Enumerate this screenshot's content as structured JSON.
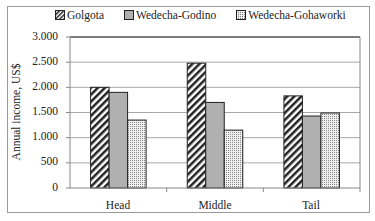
{
  "chart_data": {
    "type": "bar",
    "title": "",
    "xlabel": "",
    "ylabel": "Annual income, US$",
    "ylim": [
      0,
      3000
    ],
    "yticks": [
      0,
      500,
      1000,
      1500,
      2000,
      2500,
      3000
    ],
    "ytick_labels": [
      "0",
      "500",
      "1.000",
      "1.500",
      "2.000",
      "2.500",
      "3.000"
    ],
    "grid": true,
    "legend_position": "top",
    "categories": [
      "Head",
      "Middle",
      "Tail"
    ],
    "series": [
      {
        "name": "Golgota",
        "pattern": "diagonal-stripes",
        "values": [
          2000,
          2480,
          1830
        ]
      },
      {
        "name": "Wedecha-Godino",
        "pattern": "solid-gray",
        "values": [
          1900,
          1700,
          1430
        ]
      },
      {
        "name": "Wedecha-Gohaworki",
        "pattern": "dotted",
        "values": [
          1350,
          1150,
          1490
        ]
      }
    ]
  },
  "legend": {
    "items": [
      "Golgota",
      "Wedecha-Godino",
      "Wedecha-Gohaworki"
    ]
  },
  "axis": {
    "ylabel": "Annual income, US$",
    "yticks": [
      "3.000",
      "2.500",
      "2.000",
      "1.500",
      "1.000",
      "500",
      "0"
    ],
    "xticks": [
      "Head",
      "Middle",
      "Tail"
    ]
  },
  "colors": {
    "grid": "#a8a8a8",
    "solid_gray": "#b0b0b0",
    "bar_outline": "#222222"
  }
}
